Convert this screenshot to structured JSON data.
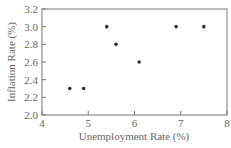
{
  "chart_data": {
    "type": "scatter",
    "title": "",
    "xlabel": "Unemployment Rate (%)",
    "ylabel": "Inflation Rate (%)",
    "xlim": [
      4,
      8
    ],
    "ylim": [
      2.0,
      3.2
    ],
    "xticks": [
      4,
      5,
      6,
      7,
      8
    ],
    "yticks": [
      2.0,
      2.2,
      2.4,
      2.6,
      2.8,
      3.0,
      3.2
    ],
    "xtick_labels": [
      "4",
      "5",
      "6",
      "7",
      "8"
    ],
    "ytick_labels": [
      "2.0",
      "2.2",
      "2.4",
      "2.6",
      "2.8",
      "3.0",
      "3.2"
    ],
    "grid": false,
    "legend": null,
    "points": [
      {
        "x": 4.6,
        "y": 2.3
      },
      {
        "x": 4.9,
        "y": 2.3
      },
      {
        "x": 5.4,
        "y": 3.0
      },
      {
        "x": 5.6,
        "y": 2.8
      },
      {
        "x": 6.1,
        "y": 2.6
      },
      {
        "x": 6.9,
        "y": 3.0
      },
      {
        "x": 7.5,
        "y": 3.0
      }
    ],
    "colors": {
      "marker": "#333333",
      "axis": "#666666",
      "text": "#666666"
    }
  }
}
